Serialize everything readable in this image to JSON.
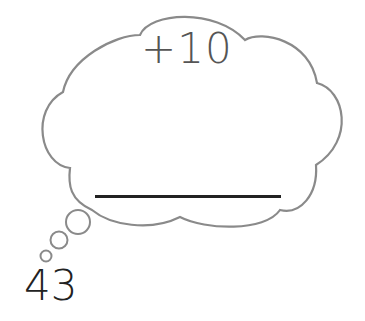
{
  "worksheet": {
    "operation": "+10",
    "start_number": "43",
    "answer": "",
    "colors": {
      "cloud_outline": "#8a8a8a",
      "operation_text": "#555555",
      "start_text": "#222222",
      "answer_line": "#222222"
    }
  }
}
